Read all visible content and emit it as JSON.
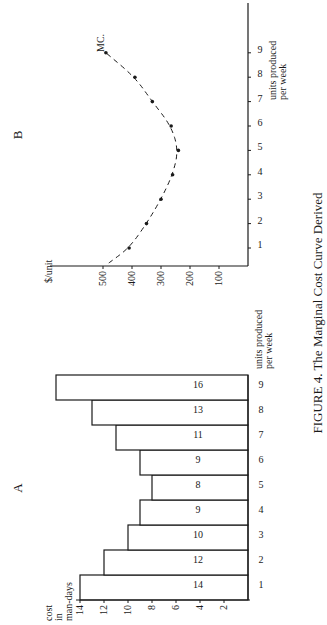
{
  "figure": {
    "caption": "FIGURE 4. The Marginal Cost Curve Derived",
    "ink_color": "#1a1a1a",
    "background": "#ffffff"
  },
  "chart_data": [
    {
      "panel": "A",
      "type": "bar",
      "title": "A",
      "xlabel": "units produced per week",
      "ylabel": "cost in man-days",
      "categories": [
        "1",
        "2",
        "3",
        "4",
        "5",
        "6",
        "7",
        "8",
        "9"
      ],
      "values": [
        14,
        12,
        10,
        9,
        8,
        9,
        11,
        13,
        16
      ],
      "bar_labels": [
        "14",
        "12",
        "10",
        "9",
        "8",
        "9",
        "11",
        "13",
        "16"
      ],
      "yticks": [
        "2",
        "4",
        "6",
        "8",
        "10",
        "12",
        "14"
      ],
      "ylim": [
        0,
        16
      ],
      "grid": false
    },
    {
      "panel": "B",
      "type": "line",
      "title": "B",
      "xlabel": "units produced per week",
      "ylabel": "$/unit",
      "series_label": "MC.",
      "x": [
        1,
        2,
        3,
        4,
        5,
        6,
        7,
        8,
        9
      ],
      "series": [
        {
          "name": "MC.",
          "values": [
            410,
            350,
            300,
            260,
            240,
            265,
            330,
            390,
            490
          ],
          "style": "dashed with dot markers"
        }
      ],
      "xticks": [
        "1",
        "2",
        "3",
        "4",
        "5",
        "6",
        "7",
        "8",
        "9"
      ],
      "yticks": [
        "100",
        "200",
        "300",
        "400",
        "500"
      ],
      "ylim": [
        0,
        600
      ],
      "grid": false
    }
  ]
}
